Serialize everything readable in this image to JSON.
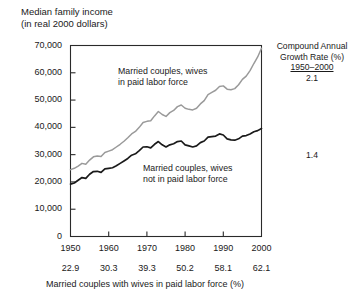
{
  "title": {
    "line1": "Median family income",
    "line2": "(in real 2000 dollars)"
  },
  "annotation": {
    "cagr_line1": "Compound Annual",
    "cagr_line2": "Growth Rate (%)",
    "cagr_period": "1950–2000",
    "cagr_upper": "2.1",
    "cagr_lower": "1.4"
  },
  "series_labels": {
    "wives_in_labor_force": "Married couples, wives\nin paid labor force",
    "wives_not_in_labor_force": "Married couples, wives\nnot in paid labor force"
  },
  "chart_data": {
    "type": "line",
    "title": "Median family income (in real 2000 dollars)",
    "xlabel": "Married couples with wives in paid labor force (%)",
    "ylabel": "Median family income (in real 2000 dollars)",
    "xlim": [
      1950,
      2000
    ],
    "ylim": [
      0,
      70000
    ],
    "grid": false,
    "legend": "inline-annotations",
    "xticks": [
      1950,
      1960,
      1970,
      1980,
      1990,
      2000
    ],
    "xticklabels": [
      "1950",
      "1960",
      "1970",
      "1980",
      "1990",
      "2000"
    ],
    "secondary_xticklabels": [
      "22.9",
      "30.3",
      "39.3",
      "50.2",
      "58.1",
      "62.1"
    ],
    "yticks": [
      0,
      10000,
      20000,
      30000,
      40000,
      50000,
      60000,
      70000
    ],
    "yticklabels": [
      "0",
      "10,000",
      "20,000",
      "30,000",
      "40,000",
      "50,000",
      "60,000",
      "70,000"
    ],
    "series": [
      {
        "name": "Married couples, wives in paid labor force",
        "color": "#9a9a9a",
        "cagr_1950_2000": 2.1,
        "x": [
          1950,
          1951,
          1952,
          1953,
          1954,
          1955,
          1956,
          1957,
          1958,
          1959,
          1960,
          1961,
          1962,
          1963,
          1964,
          1965,
          1966,
          1967,
          1968,
          1969,
          1970,
          1971,
          1972,
          1973,
          1974,
          1975,
          1976,
          1977,
          1978,
          1979,
          1980,
          1981,
          1982,
          1983,
          1984,
          1985,
          1986,
          1987,
          1988,
          1989,
          1990,
          1991,
          1992,
          1993,
          1994,
          1995,
          1996,
          1997,
          1998,
          1999,
          2000
        ],
        "values": [
          24500,
          25000,
          25800,
          26800,
          26500,
          28000,
          29200,
          29500,
          29300,
          30800,
          31300,
          31800,
          32800,
          33800,
          34900,
          36200,
          37600,
          38500,
          40000,
          41800,
          42200,
          42400,
          44200,
          45800,
          44700,
          44000,
          45400,
          46200,
          47600,
          48200,
          47000,
          46600,
          46400,
          47000,
          48600,
          49800,
          52000,
          52800,
          53600,
          55000,
          55200,
          54000,
          53800,
          54200,
          55600,
          57600,
          58800,
          60800,
          63400,
          65800,
          69000
        ]
      },
      {
        "name": "Married couples, wives not in paid labor force",
        "color": "#1a1a1a",
        "cagr_1950_2000": 1.4,
        "x": [
          1950,
          1951,
          1952,
          1953,
          1954,
          1955,
          1956,
          1957,
          1958,
          1959,
          1960,
          1961,
          1962,
          1963,
          1964,
          1965,
          1966,
          1967,
          1968,
          1969,
          1970,
          1971,
          1972,
          1973,
          1974,
          1975,
          1976,
          1977,
          1978,
          1979,
          1980,
          1981,
          1982,
          1983,
          1984,
          1985,
          1986,
          1987,
          1988,
          1989,
          1990,
          1991,
          1992,
          1993,
          1994,
          1995,
          1996,
          1997,
          1998,
          1999,
          2000
        ],
        "values": [
          19200,
          19600,
          20600,
          21600,
          21300,
          22800,
          23800,
          23900,
          23500,
          24800,
          25000,
          25200,
          25900,
          26800,
          27700,
          28600,
          29800,
          30300,
          31500,
          32800,
          32900,
          32500,
          33800,
          34800,
          33600,
          32800,
          33600,
          34000,
          34800,
          35000,
          33600,
          33200,
          32800,
          33200,
          34400,
          35000,
          36400,
          36600,
          36800,
          37600,
          37200,
          35800,
          35400,
          35300,
          35800,
          36800,
          37000,
          37600,
          38400,
          38800,
          39600
        ]
      }
    ]
  }
}
